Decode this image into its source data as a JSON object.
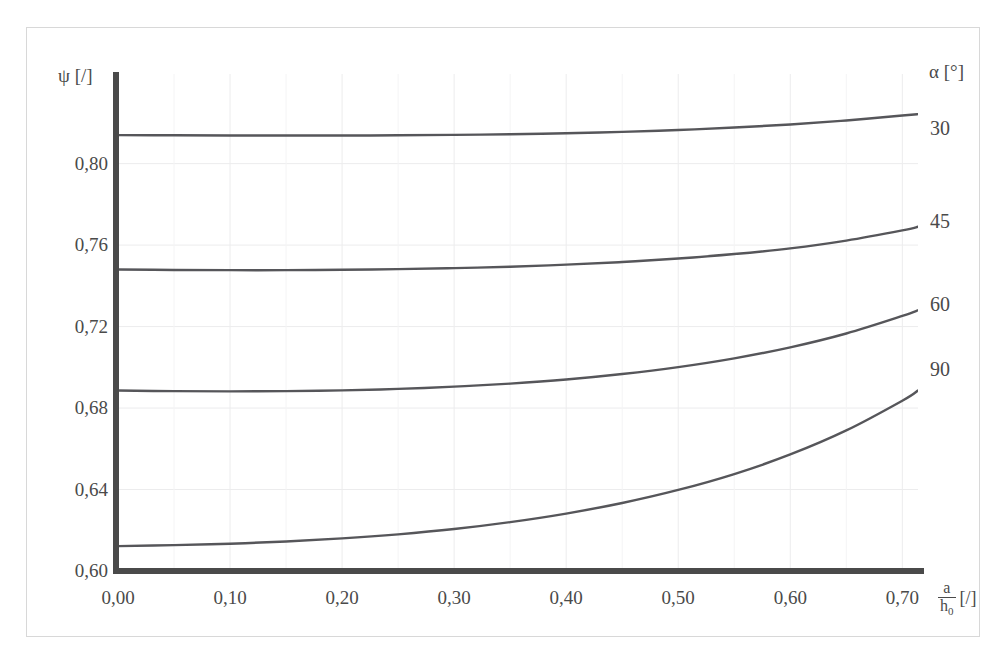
{
  "figure": {
    "top_clipped_text": "·  ·",
    "frame_color": "#d8d8d8",
    "axis_color": "#4a4a4a",
    "curve_color": "#56565a",
    "grid_color": "#ececed",
    "background": "#ffffff"
  },
  "axes": {
    "y_title": "ψ [/]",
    "y_ticks": [
      "0,80",
      "0,76",
      "0,72",
      "0,68",
      "0,64",
      "0,60"
    ],
    "y_tick_values": [
      0.8,
      0.76,
      0.72,
      0.68,
      0.64,
      0.6
    ],
    "x_ticks": [
      "0,00",
      "0,10",
      "0,20",
      "0,30",
      "0,40",
      "0,50",
      "0,60",
      "0,70"
    ],
    "x_tick_values": [
      0.0,
      0.1,
      0.2,
      0.3,
      0.4,
      0.5,
      0.6,
      0.7
    ],
    "x_title_numerator": "a",
    "x_title_denominator": "h",
    "x_title_denominator_sub": "0",
    "x_title_unit": "[/]"
  },
  "legend": {
    "title": "α [°]",
    "entries": [
      {
        "label": "30",
        "y_px": 118
      },
      {
        "label": "45",
        "y_px": 211
      },
      {
        "label": "60",
        "y_px": 294
      },
      {
        "label": "90",
        "y_px": 359
      }
    ]
  },
  "chart_data": {
    "type": "line",
    "title": "",
    "xlabel": "a/h₀ [/]",
    "ylabel": "ψ [/]",
    "xlim": [
      0.0,
      0.714
    ],
    "ylim": [
      0.6,
      0.844
    ],
    "grid": true,
    "legend_position": "right",
    "legend_title": "α [°]",
    "x": [
      0.0,
      0.05,
      0.1,
      0.15,
      0.2,
      0.25,
      0.3,
      0.35,
      0.4,
      0.45,
      0.5,
      0.55,
      0.6,
      0.65,
      0.7,
      0.714
    ],
    "series": [
      {
        "name": "30",
        "values": [
          0.814,
          0.8139,
          0.8138,
          0.8138,
          0.8138,
          0.8139,
          0.8141,
          0.8144,
          0.8149,
          0.8156,
          0.8165,
          0.8177,
          0.8192,
          0.8212,
          0.8236,
          0.8243
        ]
      },
      {
        "name": "45",
        "values": [
          0.748,
          0.7478,
          0.7477,
          0.7477,
          0.7479,
          0.7482,
          0.7487,
          0.7494,
          0.7504,
          0.7517,
          0.7534,
          0.7556,
          0.7584,
          0.7622,
          0.7672,
          0.769
        ]
      },
      {
        "name": "60",
        "values": [
          0.6886,
          0.6883,
          0.6882,
          0.6883,
          0.6887,
          0.6894,
          0.6905,
          0.692,
          0.694,
          0.6967,
          0.7001,
          0.7044,
          0.7098,
          0.7166,
          0.7252,
          0.728
        ]
      },
      {
        "name": "90",
        "values": [
          0.6122,
          0.6127,
          0.6134,
          0.6145,
          0.616,
          0.618,
          0.6206,
          0.624,
          0.6282,
          0.6334,
          0.6398,
          0.6476,
          0.6572,
          0.669,
          0.6836,
          0.6886
        ]
      }
    ]
  }
}
